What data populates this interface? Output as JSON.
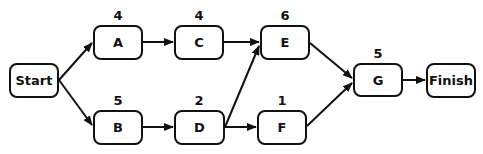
{
  "nodes": {
    "start": {
      "label": "Start"
    },
    "a": {
      "label": "A",
      "duration": "4"
    },
    "b": {
      "label": "B",
      "duration": "5"
    },
    "c": {
      "label": "C",
      "duration": "4"
    },
    "d": {
      "label": "D",
      "duration": "2"
    },
    "e": {
      "label": "E",
      "duration": "6"
    },
    "f": {
      "label": "F",
      "duration": "1"
    },
    "g": {
      "label": "G",
      "duration": "5"
    },
    "finish": {
      "label": "Finish"
    }
  },
  "edges": [
    [
      "Start",
      "A"
    ],
    [
      "Start",
      "B"
    ],
    [
      "A",
      "C"
    ],
    [
      "C",
      "E"
    ],
    [
      "B",
      "D"
    ],
    [
      "D",
      "E"
    ],
    [
      "D",
      "F"
    ],
    [
      "E",
      "G"
    ],
    [
      "F",
      "G"
    ],
    [
      "G",
      "Finish"
    ]
  ],
  "colors": {
    "stroke": "#111111",
    "background": "#ffffff"
  }
}
